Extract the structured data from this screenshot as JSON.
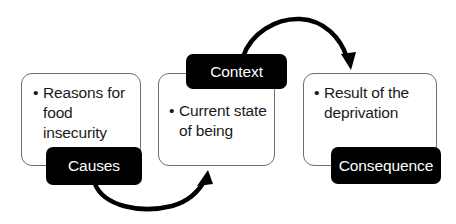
{
  "diagram": {
    "type": "flow-diagram",
    "canvas": {
      "width": 456,
      "height": 224,
      "background": "#ffffff"
    },
    "palette": {
      "panel_border": "#6f6f6f",
      "panel_fill": "#ffffff",
      "tag_fill": "#000000",
      "tag_text": "#ffffff",
      "body_text": "#1a1a1a",
      "arrow": "#000000"
    },
    "nodes": [
      {
        "id": "causes",
        "tag_label": "Causes",
        "tag_position": "bottom-right",
        "bullets": [
          "Reasons for food insecurity"
        ]
      },
      {
        "id": "context",
        "tag_label": "Context",
        "tag_position": "top-center",
        "bullets": [
          "Current state of being"
        ]
      },
      {
        "id": "consequence",
        "tag_label": "Consequence",
        "tag_position": "bottom-right",
        "bullets": [
          "Result of the deprivation"
        ]
      }
    ],
    "connectors": [
      {
        "id": "causes-to-context",
        "from": "causes",
        "to": "context",
        "shape": "curved-arc-below",
        "direction": "left-to-right"
      },
      {
        "id": "context-to-consequence",
        "from": "context",
        "to": "consequence",
        "shape": "curved-arc-above",
        "direction": "left-to-right"
      }
    ]
  }
}
